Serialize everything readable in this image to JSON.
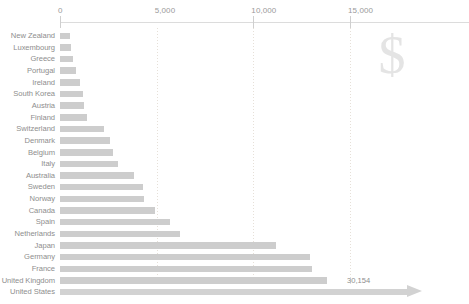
{
  "chart_data": {
    "type": "bar",
    "orientation": "horizontal",
    "title": "",
    "subtitle": "",
    "xlabel": "",
    "ylabel": "",
    "xlim": [
      0,
      17000
    ],
    "axis_ticks": [
      {
        "label": "0",
        "value": 0
      },
      {
        "label": "5,000",
        "value": 5000
      },
      {
        "label": "10,000",
        "value": 10000
      },
      {
        "label": "15,000",
        "value": 15000
      }
    ],
    "grid": "vertical-dotted",
    "legend": "none",
    "watermark": "$",
    "categories": [
      "New Zealand",
      "Luxembourg",
      "Greece",
      "Portugal",
      "Ireland",
      "South Korea",
      "Austria",
      "Finland",
      "Switzerland",
      "Denmark",
      "Belgium",
      "Italy",
      "Australia",
      "Sweden",
      "Norway",
      "Canada",
      "Spain",
      "Netherlands",
      "Japan",
      "Germany",
      "France",
      "United Kingdom",
      "United States"
    ],
    "values": [
      520,
      570,
      670,
      830,
      1030,
      1190,
      1240,
      1390,
      2270,
      2580,
      2740,
      3000,
      3820,
      4280,
      4330,
      4900,
      5680,
      6200,
      11150,
      12950,
      13060,
      13830,
      30154
    ],
    "annotations": [
      {
        "category": "United States",
        "label": "30,154",
        "note": "bar extends beyond axis, drawn with arrow"
      }
    ],
    "colors": {
      "bar": "#cdcdcd",
      "text": "#8e8e8e",
      "axis": "#dcdcdc",
      "gridline": "#e6e0d8",
      "watermark": "#e4e4e4",
      "background": "#ffffff"
    }
  }
}
